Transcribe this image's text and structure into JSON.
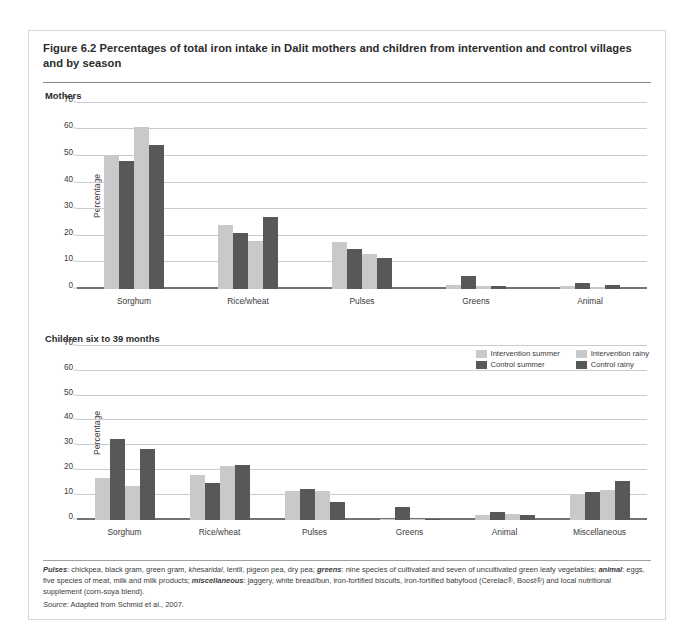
{
  "figure": {
    "number": "Figure 6.2",
    "title": "Percentages of total iron intake in Dalit mothers and children from intervention and control villages and by season"
  },
  "legend": {
    "items": [
      {
        "label": "Intervention summer",
        "color": "#c9c9c9"
      },
      {
        "label": "Intervention rainy",
        "color": "#c9c9c9"
      },
      {
        "label": "Control summer",
        "color": "#585858"
      },
      {
        "label": "Control rainy",
        "color": "#585858"
      }
    ]
  },
  "notes": {
    "definitions_html": "<b>Pulses</b>: chickpea, black gram, green gram, <i>khesaridal</i>, lentil, pigeon pea, dry pea; <b>greens</b>: nine species of cultivated and seven of uncultivated green leafy vegetables; <b>animal</b>: eggs, five species of meat, milk and milk products; <b>miscellaneous</b>: jaggery, white bread/bun, iron-fortified biscuits, iron-fortified babyfood (Cerelac®, Boost®) and local nutritional supplement (corn-soya blend).",
    "source_label": "Source:",
    "source_text": "Adapted from Schmid et al., 2007."
  },
  "chart_data": [
    {
      "type": "bar",
      "title": "Mothers",
      "xlabel": "",
      "ylabel": "Percentage",
      "ylim": [
        0,
        70
      ],
      "yticks": [
        0,
        10,
        20,
        30,
        40,
        50,
        60,
        70
      ],
      "grid": true,
      "legend_position": "below-right",
      "categories": [
        "Sorghum",
        "Rice/wheat",
        "Pulses",
        "Greens",
        "Animal"
      ],
      "series": [
        {
          "name": "Intervention summer",
          "color": "#c9c9c9",
          "values": [
            50,
            24,
            17.5,
            1.5,
            1
          ]
        },
        {
          "name": "Control summer",
          "color": "#585858",
          "values": [
            48,
            21,
            15,
            5,
            2
          ]
        },
        {
          "name": "Intervention rainy",
          "color": "#c9c9c9",
          "values": [
            61,
            18,
            13,
            1,
            0.7
          ]
        },
        {
          "name": "Control rainy",
          "color": "#585858",
          "values": [
            54,
            27,
            11.5,
            1,
            1.5
          ]
        }
      ]
    },
    {
      "type": "bar",
      "title": "Children six to 39 months",
      "xlabel": "",
      "ylabel": "Percentage",
      "ylim": [
        0,
        70
      ],
      "yticks": [
        0,
        10,
        20,
        30,
        40,
        50,
        60,
        70
      ],
      "grid": true,
      "legend_position": "none",
      "categories": [
        "Sorghum",
        "Rice/wheat",
        "Pulses",
        "Greens",
        "Animal",
        "Miscellaneous"
      ],
      "series": [
        {
          "name": "Intervention summer",
          "color": "#c9c9c9",
          "values": [
            17,
            18,
            11.5,
            0.5,
            2,
            10
          ]
        },
        {
          "name": "Control summer",
          "color": "#585858",
          "values": [
            32.5,
            15,
            12.5,
            5,
            3,
            11
          ]
        },
        {
          "name": "Intervention rainy",
          "color": "#c9c9c9",
          "values": [
            13.5,
            21.5,
            11.5,
            0.5,
            2.5,
            12
          ]
        },
        {
          "name": "Control rainy",
          "color": "#585858",
          "values": [
            28.5,
            22,
            7,
            0.5,
            2,
            15.5
          ]
        }
      ]
    }
  ]
}
